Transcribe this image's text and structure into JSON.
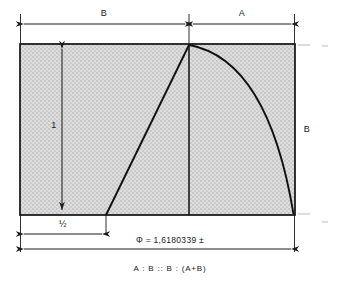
{
  "figure": {
    "labels": {
      "top_left_segment": "B",
      "top_right_segment": "A",
      "left_vertical": "1",
      "right_vertical": "B",
      "half_segment": "½",
      "phi_equation": "Φ = 1,6180339 ±",
      "proportion": "A : B :: B : (A+B)"
    },
    "colors": {
      "ink": "#1a1a1a",
      "stroke": "#111111",
      "fill": "#d8d8d8",
      "paper": "#ffffff",
      "faint": "#b9b9b9"
    },
    "geometry": {
      "rect_x": 20,
      "rect_y": 44,
      "rect_width": 275,
      "rect_height": 171,
      "divider_x": 189,
      "half_x": 106,
      "apex_x": 189,
      "apex_y": 44
    },
    "construction": {
      "type": "golden-rectangle",
      "phi_value": 1.6180339,
      "relation": "A : B :: B : (A+B)",
      "unit_height": 1,
      "half_base": 0.5
    }
  }
}
